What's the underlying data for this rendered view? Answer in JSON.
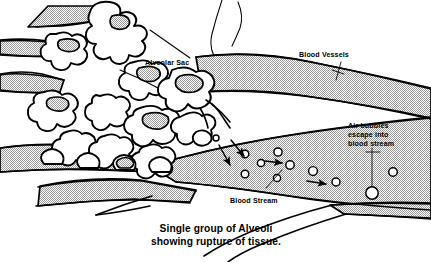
{
  "figure": {
    "title": "Single group of Alveoli showing rupture of tissue.",
    "background_color": "#ffffff",
    "ink_color": "#000000",
    "vessel_fill_color": "#d8d8d8",
    "width": 431,
    "height": 262
  },
  "labels": {
    "alveolar_sac": "Alveolar Sac",
    "blood_vessels": "Blood Vessels",
    "blood_stream": "Blood Stream",
    "air_bubbles_line1": "Air bubbles",
    "air_bubbles_line2": "escape into",
    "air_bubbles_line3": "blood stream"
  },
  "caption": {
    "line1": "Single group of Alveoli",
    "line2": "showing rupture of tissue."
  },
  "bubbles": [
    {
      "cx": 216,
      "cy": 138,
      "r": 3.0
    },
    {
      "cx": 245,
      "cy": 154,
      "r": 3.8
    },
    {
      "cx": 261,
      "cy": 163,
      "r": 3.6
    },
    {
      "cx": 245,
      "cy": 174,
      "r": 3.8
    },
    {
      "cx": 278,
      "cy": 152,
      "r": 4.1
    },
    {
      "cx": 277,
      "cy": 178,
      "r": 3.6
    },
    {
      "cx": 290,
      "cy": 165,
      "r": 4.2
    },
    {
      "cx": 313,
      "cy": 171,
      "r": 4.4
    },
    {
      "cx": 336,
      "cy": 182,
      "r": 4.0
    },
    {
      "cx": 393,
      "cy": 172,
      "r": 4.3
    },
    {
      "cx": 372,
      "cy": 193,
      "r": 6.2
    }
  ],
  "arrows": [
    {
      "name": "rupture-arrow-down",
      "x1": 219,
      "y1": 145,
      "x2": 231,
      "y2": 167
    },
    {
      "name": "rupture-arrow-right",
      "x1": 231,
      "y1": 140,
      "x2": 245,
      "y2": 158
    },
    {
      "name": "flow-arrow-mid",
      "x1": 263,
      "y1": 161,
      "x2": 283,
      "y2": 163
    },
    {
      "name": "flow-arrow-right",
      "x1": 307,
      "y1": 181,
      "x2": 327,
      "y2": 184
    }
  ],
  "icons": {
    "leader_line": "leader-line",
    "flow_arrow": "flow-arrow-icon",
    "air_bubble": "air-bubble-icon"
  }
}
